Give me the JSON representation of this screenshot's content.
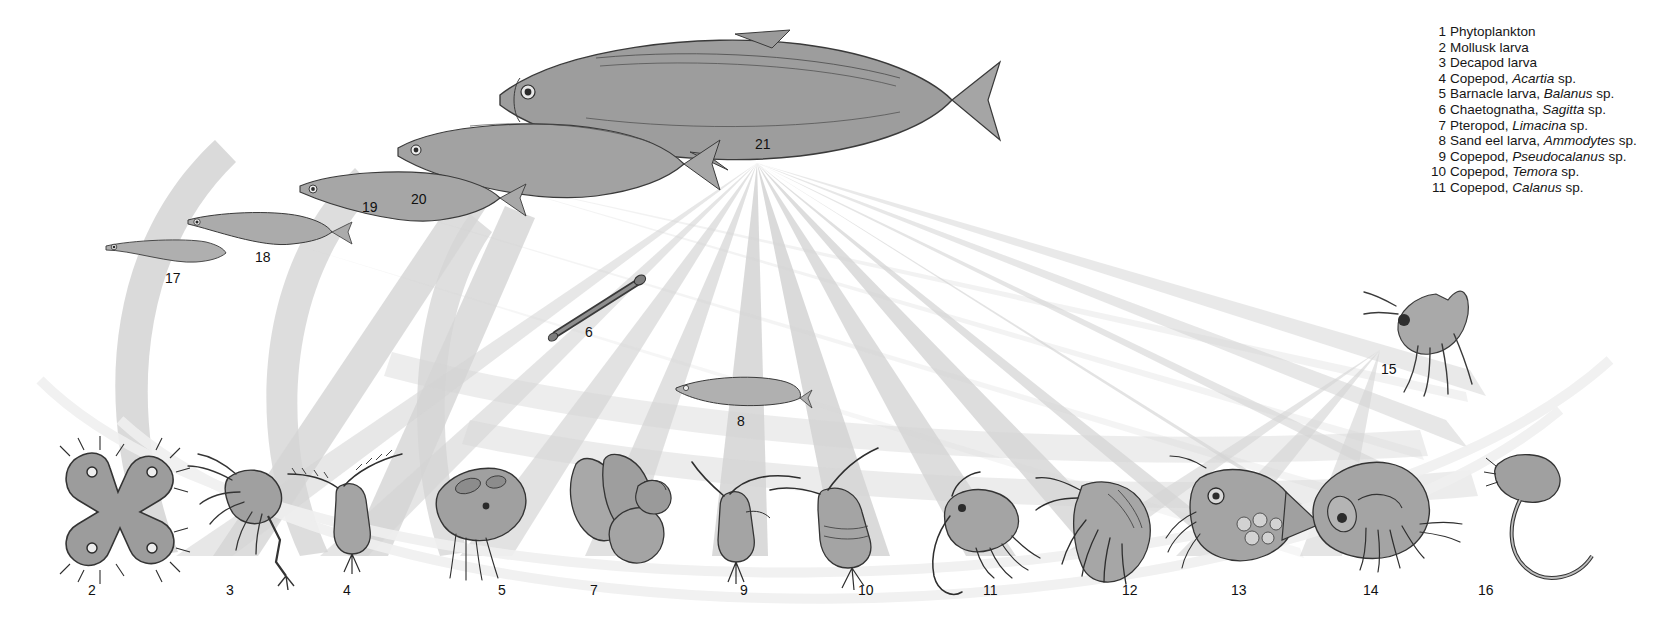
{
  "figure": {
    "kind": "food-web-diagram",
    "top_cropped_line": "",
    "background_color": "#ffffff",
    "ribbon_color": "#d2d2d2",
    "ribbon_color_light": "#e7e7e7",
    "ink_color": "#4d4d4d"
  },
  "legend": {
    "items": [
      {
        "num": "1",
        "text": "Phytoplankton",
        "italic": ""
      },
      {
        "num": "2",
        "text": "Mollusk larva",
        "italic": ""
      },
      {
        "num": "3",
        "text": "Decapod larva",
        "italic": ""
      },
      {
        "num": "4",
        "text": "Copepod, ",
        "italic": "Acartia",
        "tail": " sp."
      },
      {
        "num": "5",
        "text": "Barnacle larva, ",
        "italic": "Balanus",
        "tail": " sp."
      },
      {
        "num": "6",
        "text": "Chaetognatha, ",
        "italic": "Sagitta",
        "tail": " sp."
      },
      {
        "num": "7",
        "text": "Pteropod, ",
        "italic": "Limacina",
        "tail": " sp."
      },
      {
        "num": "8",
        "text": "Sand eel larva, ",
        "italic": "Ammodytes",
        "tail": " sp."
      },
      {
        "num": "9",
        "text": "Copepod, ",
        "italic": "Pseudocalanus",
        "tail": " sp."
      },
      {
        "num": "10",
        "text": "Copepod, ",
        "italic": "Temora",
        "tail": " sp."
      },
      {
        "num": "11",
        "text": "Copepod, ",
        "italic": "Calanus",
        "tail": " sp."
      }
    ]
  },
  "nodes": [
    {
      "id": "n2",
      "label": "2",
      "name": "mollusk-larva",
      "lx": 88,
      "ly": 583
    },
    {
      "id": "n3",
      "label": "3",
      "name": "decapod-larva",
      "lx": 226,
      "ly": 583
    },
    {
      "id": "n4",
      "label": "4",
      "name": "copepod-acartia",
      "lx": 343,
      "ly": 583
    },
    {
      "id": "n5",
      "label": "5",
      "name": "barnacle-larva",
      "lx": 498,
      "ly": 583
    },
    {
      "id": "n6",
      "label": "6",
      "name": "chaetognath-sagitta",
      "lx": 585,
      "ly": 325
    },
    {
      "id": "n7",
      "label": "7",
      "name": "pteropod-limacina",
      "lx": 590,
      "ly": 583
    },
    {
      "id": "n8",
      "label": "8",
      "name": "sand-eel-larva",
      "lx": 737,
      "ly": 414
    },
    {
      "id": "n9",
      "label": "9",
      "name": "copepod-pseudocalanus",
      "lx": 740,
      "ly": 583
    },
    {
      "id": "n10",
      "label": "10",
      "name": "copepod-temora",
      "lx": 858,
      "ly": 583
    },
    {
      "id": "n11",
      "label": "11",
      "name": "copepod-calanus",
      "lx": 983,
      "ly": 583
    },
    {
      "id": "n12",
      "label": "12",
      "name": "amphipod-12",
      "lx": 1122,
      "ly": 583
    },
    {
      "id": "n13",
      "label": "13",
      "name": "larvacean-13",
      "lx": 1231,
      "ly": 583
    },
    {
      "id": "n14",
      "label": "14",
      "name": "mollusk-14",
      "lx": 1363,
      "ly": 583
    },
    {
      "id": "n15",
      "label": "15",
      "name": "amphipod-15",
      "lx": 1381,
      "ly": 362
    },
    {
      "id": "n16",
      "label": "16",
      "name": "worm-16",
      "lx": 1478,
      "ly": 583
    },
    {
      "id": "n17",
      "label": "17",
      "name": "herring-larva-17",
      "lx": 165,
      "ly": 271
    },
    {
      "id": "n18",
      "label": "18",
      "name": "herring-larva-18",
      "lx": 255,
      "ly": 250
    },
    {
      "id": "n19",
      "label": "19",
      "name": "herring-juvenile-19",
      "lx": 362,
      "ly": 200
    },
    {
      "id": "n20",
      "label": "20",
      "name": "herring-subadult-20",
      "lx": 411,
      "ly": 192
    },
    {
      "id": "n21",
      "label": "21",
      "name": "herring-adult-21",
      "lx": 755,
      "ly": 137
    }
  ]
}
